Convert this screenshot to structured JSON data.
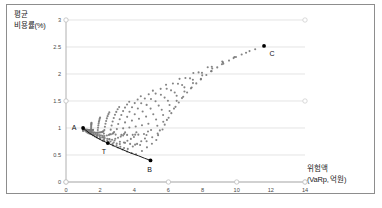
{
  "axes": {
    "y_title_line1": "평균",
    "y_title_line2": "비용률(%)",
    "x_title_line1": "위험액",
    "x_title_line2": "(VaRp, 억원)"
  },
  "chart_data": {
    "type": "scatter",
    "title": "",
    "subtitle": "",
    "xlabel": "위험액 (VaRp, 억원)",
    "ylabel": "평균 비용률(%)",
    "xlim": [
      0,
      14
    ],
    "ylim": [
      0,
      3
    ],
    "xticks": [
      "0",
      "2",
      "4",
      "6",
      "8",
      "10",
      "12",
      "14"
    ],
    "xtick_values": [
      0,
      2,
      4,
      6,
      8,
      10,
      12,
      14
    ],
    "yticks": [
      "0",
      "0.5",
      "1",
      "1.5",
      "2",
      "2.5",
      "3"
    ],
    "ytick_values": [
      0,
      0.5,
      1,
      1.5,
      2,
      2.5,
      3
    ],
    "grid": "horizontal",
    "legend": "none",
    "point_color": "#7a7a7a",
    "marker_color": "#000000",
    "frontier_color": "#1a1a1a",
    "annotations": [
      {
        "label": "A",
        "x": 1.0,
        "y": 1.0,
        "dx": -9,
        "dy": 2
      },
      {
        "label": "T",
        "x": 2.45,
        "y": 0.72,
        "dx": -4,
        "dy": 11
      },
      {
        "label": "B",
        "x": 4.95,
        "y": 0.4,
        "dx": -1,
        "dy": 12
      },
      {
        "label": "C",
        "x": 11.6,
        "y": 2.52,
        "dx": 8,
        "dy": 10
      }
    ],
    "frontier_curve": {
      "name": "efficient frontier A-T-B",
      "points": [
        [
          1.0,
          1.0
        ],
        [
          1.35,
          0.91
        ],
        [
          1.75,
          0.83
        ],
        [
          2.1,
          0.77
        ],
        [
          2.45,
          0.72
        ],
        [
          2.9,
          0.655
        ],
        [
          3.35,
          0.595
        ],
        [
          3.8,
          0.535
        ],
        [
          4.25,
          0.485
        ],
        [
          4.6,
          0.44
        ],
        [
          4.95,
          0.4
        ]
      ]
    },
    "cloud": {
      "description": "fan of curved arcs of portfolio points emanating from A and converging toward C",
      "n_arcs": 17,
      "pts_per_arc": 18,
      "anchor_a": [
        1.0,
        1.0
      ],
      "anchor_c": [
        11.6,
        2.52
      ],
      "lower_envelope": [
        [
          1.0,
          1.0
        ],
        [
          1.6,
          0.86
        ],
        [
          2.3,
          0.74
        ],
        [
          3.0,
          0.64
        ],
        [
          3.7,
          0.545
        ],
        [
          4.4,
          0.465
        ],
        [
          4.95,
          0.4
        ]
      ],
      "upper_envelope": [
        [
          1.0,
          1.0
        ],
        [
          1.7,
          1.14
        ],
        [
          2.6,
          1.3
        ],
        [
          3.6,
          1.47
        ],
        [
          4.8,
          1.65
        ],
        [
          6.2,
          1.85
        ],
        [
          7.7,
          2.05
        ],
        [
          9.3,
          2.25
        ],
        [
          10.6,
          2.4
        ],
        [
          11.6,
          2.52
        ]
      ],
      "arc_tips": [
        [
          1.55,
          0.565
        ],
        [
          2.05,
          0.49
        ],
        [
          2.55,
          0.445
        ],
        [
          3.05,
          0.425
        ],
        [
          3.55,
          0.42
        ],
        [
          4.05,
          0.43
        ],
        [
          4.5,
          0.46
        ],
        [
          4.95,
          0.52
        ],
        [
          5.3,
          0.62
        ],
        [
          5.55,
          0.74
        ],
        [
          5.7,
          0.88
        ],
        [
          5.8,
          1.02
        ]
      ]
    }
  }
}
